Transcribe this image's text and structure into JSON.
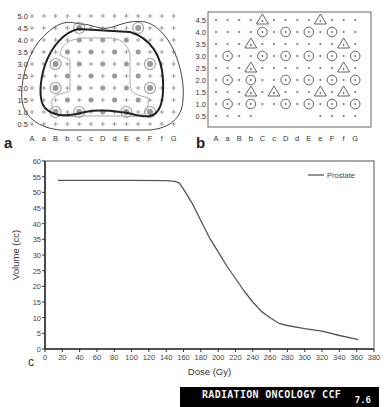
{
  "panel_a": {
    "label": "a",
    "y_ticks": [
      "5.0",
      "4.5",
      "4.0",
      "3.5",
      "3.0",
      "2.5",
      "2.0",
      "1.5",
      "1.0",
      "0.5"
    ],
    "x_ticks": [
      "A",
      "a",
      "B",
      "b",
      "C",
      "c",
      "D",
      "d",
      "E",
      "e",
      "F",
      "f",
      "G"
    ]
  },
  "panel_b": {
    "label": "b",
    "y_ticks": [
      "4.5",
      "4.0",
      "3.5",
      "3.0",
      "2.5",
      "2.0",
      "1.5",
      "1.0",
      "0.5"
    ],
    "x_ticks": [
      "A",
      "a",
      "B",
      "b",
      "C",
      "c",
      "D",
      "d",
      "E",
      "e",
      "F",
      "f",
      "G"
    ]
  },
  "panel_c": {
    "label": "c"
  },
  "chart_data": {
    "type": "line",
    "title": "",
    "xlabel": "Dose (Gy)",
    "ylabel": "Volume (cc)",
    "xlim": [
      0,
      380
    ],
    "ylim": [
      0,
      60
    ],
    "x_ticks": [
      "0",
      "20",
      "40",
      "60",
      "80",
      "100",
      "120",
      "140",
      "160",
      "180",
      "200",
      "220",
      "240",
      "260",
      "280",
      "300",
      "320",
      "340",
      "360",
      "380"
    ],
    "y_ticks": [
      "0",
      "5",
      "10",
      "15",
      "20",
      "25",
      "30",
      "35",
      "40",
      "45",
      "50",
      "55",
      "60"
    ],
    "grid": false,
    "legend_position": "upper right",
    "series": [
      {
        "name": "Prostate",
        "color": "#555555",
        "x": [
          15,
          60,
          100,
          140,
          150,
          155,
          160,
          170,
          180,
          190,
          200,
          210,
          220,
          230,
          240,
          250,
          260,
          270,
          280,
          300,
          320,
          340,
          362
        ],
        "values": [
          53.8,
          53.8,
          53.8,
          53.7,
          53.5,
          53.0,
          51.0,
          46.5,
          41.0,
          35.5,
          31.0,
          26.5,
          22.5,
          18.5,
          15.0,
          12.0,
          10.0,
          8.2,
          7.5,
          6.5,
          5.7,
          4.3,
          3.0
        ]
      }
    ]
  },
  "banner": {
    "title": "RADIATION ONCOLOGY CCF",
    "version": "7.6"
  }
}
